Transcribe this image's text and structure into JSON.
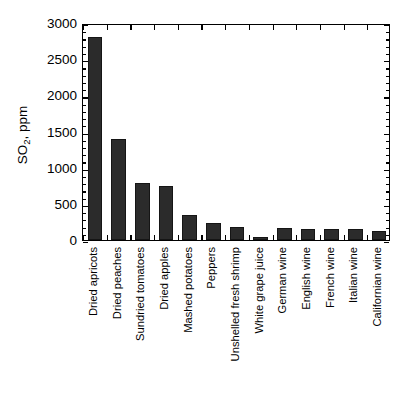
{
  "chart_data": {
    "type": "bar",
    "title": "",
    "subtitle": "",
    "xlabel": "",
    "ylabel": "SO2, ppm",
    "ylabel_parts": {
      "prefix": "SO",
      "subscript": "2",
      "suffix": ", ppm"
    },
    "ylim": [
      0,
      3000
    ],
    "ytick_values": [
      0,
      500,
      1000,
      1500,
      2000,
      2500,
      3000
    ],
    "ytick_labels": [
      "0",
      "500",
      "1000",
      "1500",
      "2000",
      "2500",
      "3000"
    ],
    "minor_tick_interval": 100,
    "grid": false,
    "legend": false,
    "frame": "box",
    "tick_direction": "in",
    "bar_color": "#2b2b2b",
    "categories": [
      "Dried apricots",
      "Dried peaches",
      "Sundried tomatoes",
      "Dried apples",
      "Mashed potatoes",
      "Peppers",
      "Unshelled fresh shrimp",
      "White grape juice",
      "German wine",
      "English wine",
      "French wine",
      "Italian wine",
      "Californian wine"
    ],
    "values": [
      2800,
      1400,
      790,
      745,
      345,
      230,
      180,
      45,
      170,
      155,
      150,
      150,
      130
    ],
    "n_bars": 13
  }
}
